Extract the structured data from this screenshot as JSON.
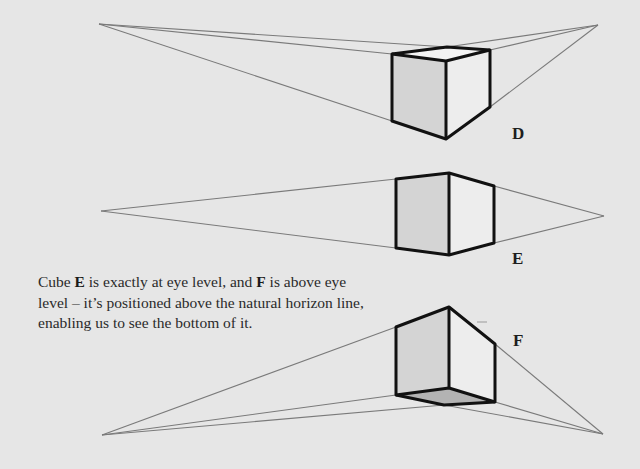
{
  "colors": {
    "background": "#e6e6e6",
    "construction_line": "#7a7a7a",
    "edge": "#111111",
    "left_face": "#d4d4d4",
    "right_face": "#ededed",
    "top_face": "#f3f3f3",
    "bottom_face": "#b3b3b3"
  },
  "cubes": [
    {
      "id": "D",
      "label": "D",
      "position": "below eye level",
      "label_pos": [
        512,
        126
      ],
      "vp_left": [
        99,
        24
      ],
      "vp_right": [
        598,
        25
      ],
      "vertices": {
        "back_top": [
          447,
          47
        ],
        "left_top": [
          392,
          54
        ],
        "right_top": [
          490,
          50
        ],
        "front_top": [
          446,
          61
        ],
        "left_bottom": [
          392,
          121
        ],
        "front_bottom": [
          446,
          139
        ],
        "right_bottom": [
          490,
          107
        ]
      }
    },
    {
      "id": "E",
      "label": "E",
      "position": "at eye level",
      "label_pos": [
        512,
        251
      ],
      "vp_left": [
        101,
        211
      ],
      "vp_right": [
        604,
        216
      ],
      "vertices": {
        "left_top": [
          396,
          179
        ],
        "front_top": [
          449,
          173
        ],
        "right_top": [
          494,
          186
        ],
        "left_bottom": [
          396,
          248
        ],
        "front_bottom": [
          449,
          255
        ],
        "right_bottom": [
          494,
          243
        ]
      }
    },
    {
      "id": "F",
      "label": "F",
      "position": "above eye level",
      "label_pos": [
        513,
        333
      ],
      "vp_left": [
        102,
        435
      ],
      "vp_right": [
        603,
        434
      ],
      "vertices": {
        "left_top": [
          396,
          327
        ],
        "front_top": [
          449,
          307
        ],
        "right_top": [
          495,
          344
        ],
        "left_bottom": [
          396,
          395
        ],
        "back_bottom": [
          449,
          388
        ],
        "front_bottom": [
          444,
          405
        ],
        "right_bottom": [
          495,
          402
        ]
      }
    }
  ],
  "caption": {
    "part1": "Cube ",
    "bold1": "E",
    "part2": " is exactly at eye level, and ",
    "bold2": "F",
    "part3": " is above eye level – it’s positioned above the natural horizon line, enabling us to see the bottom of it."
  }
}
